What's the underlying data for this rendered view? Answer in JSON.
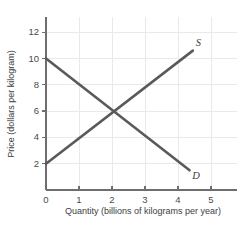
{
  "chart_data": {
    "type": "line",
    "title": "",
    "xlabel": "Quantity (billions of kilograms per year)",
    "ylabel": "Price (dollars per kilogram)",
    "xlim": [
      0,
      5.7
    ],
    "ylim": [
      0,
      13
    ],
    "xticks": [
      0,
      1,
      2,
      3,
      4,
      5
    ],
    "xtick_labels": [
      "0",
      "1",
      "2",
      "3",
      "4",
      "5"
    ],
    "yticks": [
      2,
      4,
      6,
      8,
      10,
      12
    ],
    "ytick_labels": [
      "2",
      "4",
      "6",
      "8",
      "10",
      "12"
    ],
    "origin_label": "0",
    "grid": true,
    "legend_position": "inline-curve-end",
    "series": [
      {
        "name": "S",
        "label": "S",
        "description": "Supply curve",
        "color": "#595a5c",
        "points": [
          {
            "x": 0.0,
            "y": 2.0
          },
          {
            "x": 4.45,
            "y": 10.6
          }
        ],
        "label_point": {
          "x": 4.62,
          "y": 11.1
        }
      },
      {
        "name": "D",
        "label": "D",
        "description": "Demand curve",
        "color": "#595a5c",
        "points": [
          {
            "x": 0.0,
            "y": 10.0
          },
          {
            "x": 4.35,
            "y": 1.5
          }
        ],
        "label_point": {
          "x": 4.55,
          "y": 1.0
        }
      }
    ],
    "equilibrium": {
      "x": 2.0,
      "y": 6.0
    }
  },
  "axes": {
    "x_title": "Quantity (billions of kilograms per year)",
    "y_title": "Price (dollars per kilogram)"
  },
  "colors": {
    "curve": "#595a5c",
    "axis": "#6e6e70",
    "grid": "#e9e9ea",
    "text": "#3d3d3f",
    "background": "#ffffff"
  }
}
